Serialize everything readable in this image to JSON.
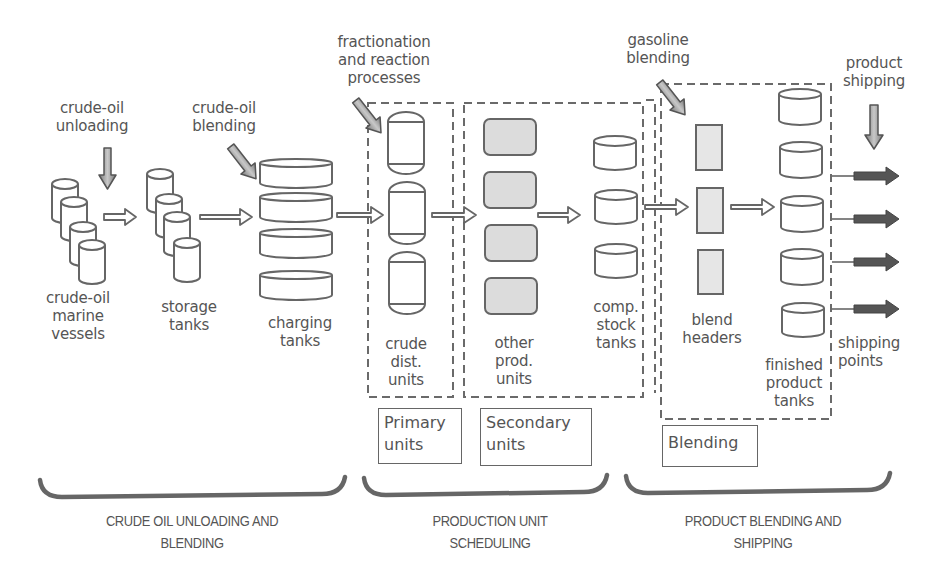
{
  "diagram": {
    "title_annotations": {
      "crude_oil_unloading": "crude-oil\nunloading",
      "crude_oil_blending": "crude-oil\nblending",
      "fractionation": "fractionation\nand reaction\nprocesses",
      "gasoline_blending": "gasoline\nblending",
      "product_shipping": "product\nshipping"
    },
    "node_labels": {
      "marine_vessels": "crude-oil\nmarine\nvessels",
      "storage_tanks": "storage\ntanks",
      "charging_tanks": "charging\ntanks",
      "crude_dist_units": "crude\ndist.\nunits",
      "other_prod_units": "other\nprod.\nunits",
      "comp_stock_tanks": "comp.\nstock\ntanks",
      "blend_headers": "blend\nheaders",
      "finished_product_tanks": "finished\nproduct\ntanks",
      "shipping_points": "shipping\npoints"
    },
    "group_boxes": {
      "primary": "Primary\nunits",
      "secondary": "Secondary\nunits",
      "blending": "Blending"
    },
    "stages": [
      {
        "label": "CRUDE OIL UNLOADING AND\nBLENDING"
      },
      {
        "label": "PRODUCTION UNIT\nSCHEDULING"
      },
      {
        "label": "PRODUCT BLENDING AND\nSHIPPING"
      }
    ],
    "colors": {
      "stroke": "#666666",
      "text": "#555555",
      "fill_gray": "#dcdcdc",
      "arrow_light": "#bdbdbd",
      "arrow_dark": "#555555"
    }
  }
}
